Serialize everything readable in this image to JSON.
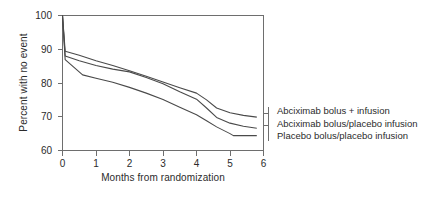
{
  "chart_data": {
    "type": "line",
    "title": "",
    "xlabel": "Months from randomization",
    "ylabel": "Percent with no event",
    "xlim": [
      0,
      6
    ],
    "ylim": [
      60,
      100
    ],
    "xticks": [
      "0",
      "1",
      "2",
      "3",
      "4",
      "5",
      "6"
    ],
    "yticks": [
      "60",
      "70",
      "80",
      "90",
      "100"
    ],
    "grid": false,
    "legend_position": "right",
    "line_color": "#4a4a4a",
    "series": [
      {
        "name": "Abciximab bolus + infusion",
        "x": [
          0,
          0.08,
          0.5,
          1,
          1.5,
          2,
          2.5,
          3,
          3.5,
          4,
          4.3,
          4.6,
          5,
          5.4,
          5.8
        ],
        "values": [
          100,
          89.4,
          88.2,
          86.6,
          85.2,
          83.6,
          82.0,
          80.3,
          78.6,
          77.0,
          75.0,
          72.6,
          71.2,
          70.4,
          69.9
        ]
      },
      {
        "name": "Abciximab bolus/placebo infusion",
        "x": [
          0,
          0.08,
          0.5,
          1,
          1.5,
          2,
          2.5,
          3,
          3.5,
          4,
          4.3,
          4.6,
          5,
          5.4,
          5.8
        ],
        "values": [
          100,
          88.0,
          86.6,
          85.2,
          84.1,
          83.3,
          81.6,
          79.8,
          77.4,
          75.2,
          72.6,
          69.8,
          68.1,
          67.2,
          66.6
        ]
      },
      {
        "name": "Placebo bolus/placebo infusion",
        "x": [
          0,
          0.08,
          0.6,
          1,
          1.5,
          2,
          2.5,
          3,
          3.5,
          4,
          4.3,
          4.6,
          5,
          5.1,
          5.8
        ],
        "values": [
          100,
          86.9,
          82.4,
          81.4,
          80.2,
          78.7,
          77.0,
          75.1,
          72.8,
          70.6,
          68.8,
          67.0,
          65.0,
          64.4,
          64.4
        ]
      }
    ]
  },
  "legend": {
    "items": [
      "Abciximab bolus + infusion",
      "Abciximab bolus/placebo infusion",
      "Placebo bolus/placebo infusion"
    ]
  }
}
